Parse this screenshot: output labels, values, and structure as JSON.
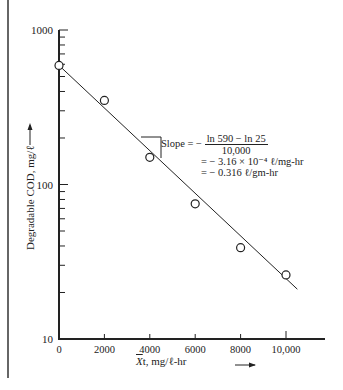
{
  "chart_data": {
    "type": "scatter",
    "yscale": "log",
    "title": "",
    "xlabel": "X̄t, mg/ℓ-hr",
    "ylabel": "Degradable COD, mg/ℓ",
    "xlim": [
      0,
      11500
    ],
    "ylim": [
      10,
      1000
    ],
    "x_ticks": [
      "0",
      "2000",
      "4000",
      "6000",
      "8000",
      "10,000"
    ],
    "y_ticks": [
      "10",
      "100",
      "1000"
    ],
    "grid": false,
    "series": [
      {
        "name": "observed",
        "marker": "open-circle",
        "x": [
          0,
          2000,
          4000,
          6000,
          8000,
          10000
        ],
        "y": [
          590,
          350,
          150,
          75,
          39,
          26
        ]
      },
      {
        "name": "fit",
        "style": "line",
        "x": [
          0,
          10500
        ],
        "y": [
          590,
          21
        ]
      }
    ],
    "annotations": [
      "Slope = − (ln 590 − ln 25) / 10,000",
      "= − 3.16 × 10⁻⁴ ℓ/mg-hr",
      "= − 0.316 ℓ/gm-hr"
    ]
  },
  "axes": {
    "y_label_text": "Degradable COD, mg/ℓ",
    "y_arrow": "→",
    "x_label_var": "X",
    "x_label_rest": "t, mg/ℓ-hr",
    "x_ticks": [
      "0",
      "2000",
      "4000",
      "6000",
      "8000",
      "10,000"
    ],
    "y_ticks": [
      "1000",
      "100",
      "10"
    ]
  },
  "slope": {
    "prefix": "Slope = −",
    "numerator": "ln 590 − ln 25",
    "denominator": "10,000",
    "line2": "= − 3.16 × 10⁻⁴ ℓ/mg-hr",
    "line3": "= − 0.316 ℓ/gm-hr"
  }
}
